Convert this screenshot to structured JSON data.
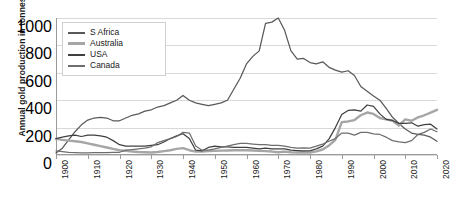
{
  "chart_data": {
    "type": "line",
    "title": "",
    "xlabel": "",
    "ylabel": "Annual gold production in tonnes",
    "xlim": [
      1900,
      2020
    ],
    "ylim": [
      0,
      1000
    ],
    "grid": true,
    "legend_position": "top-left",
    "ytick_labels": [
      "0",
      "200",
      "400",
      "600",
      "800",
      "1000"
    ],
    "ytick_values": [
      0,
      200,
      400,
      600,
      800,
      1000
    ],
    "xtick_labels": [
      "1900",
      "1910",
      "1920",
      "1930",
      "1940",
      "1950",
      "1960",
      "1970",
      "1980",
      "1990",
      "2000",
      "2010",
      "2020"
    ],
    "xtick_values": [
      1900,
      1910,
      1920,
      1930,
      1940,
      1950,
      1960,
      1970,
      1980,
      1990,
      2000,
      2010,
      2020
    ],
    "x": [
      1900,
      1902,
      1904,
      1906,
      1908,
      1910,
      1912,
      1914,
      1916,
      1918,
      1920,
      1922,
      1924,
      1926,
      1928,
      1930,
      1932,
      1934,
      1936,
      1938,
      1940,
      1942,
      1944,
      1946,
      1948,
      1950,
      1952,
      1954,
      1956,
      1958,
      1960,
      1962,
      1964,
      1966,
      1968,
      1970,
      1972,
      1974,
      1976,
      1978,
      1980,
      1982,
      1984,
      1986,
      1988,
      1990,
      1992,
      1994,
      1996,
      1998,
      2000,
      2002,
      2004,
      2006,
      2008,
      2010,
      2012,
      2014,
      2016,
      2018,
      2020
    ],
    "series": [
      {
        "name": "S Africa",
        "color": "#595959",
        "values": [
          15,
          50,
          110,
          170,
          220,
          255,
          270,
          275,
          270,
          250,
          250,
          270,
          290,
          300,
          320,
          330,
          350,
          360,
          380,
          400,
          435,
          400,
          380,
          370,
          360,
          370,
          380,
          400,
          480,
          560,
          665,
          720,
          760,
          960,
          970,
          1000,
          910,
          760,
          700,
          705,
          675,
          665,
          680,
          640,
          620,
          605,
          615,
          580,
          500,
          465,
          430,
          400,
          340,
          275,
          230,
          190,
          160,
          150,
          145,
          130,
          100
        ]
      },
      {
        "name": "Australia",
        "color": "#a6a6a6",
        "values": [
          118,
          110,
          105,
          100,
          95,
          85,
          75,
          65,
          55,
          45,
          35,
          30,
          25,
          22,
          20,
          18,
          22,
          28,
          35,
          45,
          50,
          35,
          25,
          25,
          28,
          30,
          32,
          33,
          35,
          35,
          35,
          33,
          30,
          28,
          25,
          20,
          25,
          20,
          18,
          20,
          17,
          27,
          40,
          70,
          110,
          240,
          245,
          255,
          290,
          310,
          300,
          270,
          260,
          250,
          215,
          260,
          250,
          275,
          290,
          310,
          330
        ]
      },
      {
        "name": "USA",
        "color": "#404040",
        "values": [
          120,
          130,
          140,
          145,
          135,
          145,
          145,
          140,
          130,
          105,
          75,
          65,
          65,
          65,
          65,
          70,
          75,
          95,
          120,
          140,
          155,
          120,
          35,
          30,
          55,
          65,
          60,
          60,
          55,
          55,
          55,
          50,
          45,
          50,
          45,
          45,
          45,
          35,
          32,
          30,
          30,
          45,
          65,
          118,
          200,
          295,
          325,
          330,
          320,
          365,
          355,
          300,
          260,
          252,
          230,
          230,
          235,
          210,
          222,
          225,
          190
        ]
      },
      {
        "name": "Canada",
        "color": "#6e6e6e",
        "values": [
          30,
          25,
          20,
          18,
          16,
          15,
          17,
          18,
          18,
          20,
          20,
          35,
          40,
          45,
          50,
          60,
          90,
          105,
          120,
          135,
          165,
          160,
          65,
          35,
          35,
          45,
          55,
          65,
          75,
          85,
          85,
          80,
          75,
          75,
          70,
          70,
          65,
          55,
          50,
          52,
          50,
          65,
          80,
          100,
          120,
          160,
          160,
          145,
          165,
          165,
          155,
          150,
          130,
          105,
          95,
          90,
          105,
          150,
          165,
          190,
          170
        ]
      }
    ]
  },
  "legend": {
    "items": [
      {
        "label": "S Africa"
      },
      {
        "label": "Australia"
      },
      {
        "label": "USA"
      },
      {
        "label": "Canada"
      }
    ]
  }
}
